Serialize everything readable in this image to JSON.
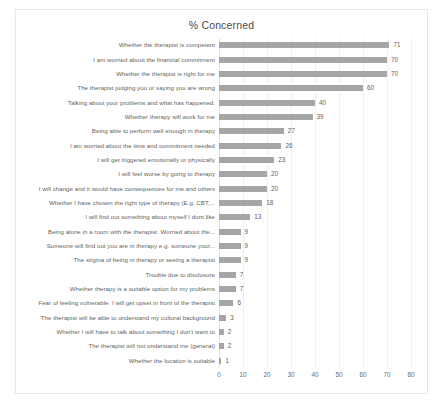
{
  "chart": {
    "title": "% Concerned"
  },
  "chart_data": {
    "type": "bar",
    "orientation": "horizontal",
    "title": "% Concerned",
    "xlabel": "",
    "ylabel": "",
    "xlim": [
      0,
      80
    ],
    "xticks": [
      0,
      10,
      20,
      30,
      40,
      50,
      60,
      70,
      80
    ],
    "grid": true,
    "legend": false,
    "bar_color": "#a6a6a6",
    "categories": [
      "Whether the therapist is competent",
      "I am worried about the financial commitment",
      "Whether the therapist is right for me",
      "The therapist judging you or saying you are wrong",
      "Talking about your problems and what has happened.",
      "Whether therapy will work for me",
      "Being able to perform well enough in therapy",
      "I am worried about the time and commitment needed",
      "I will get triggered emotionally or physically",
      "I will feel worse by going to therapy",
      "I will change and it would have consequences for me and others",
      "Whether I have chosen the right type of therapy (E.g. CBT,...",
      "I will find out something about myself I dont like",
      "Being alone in a room with the therapist. Worried about the...",
      "Someone will find out you are in therapy e.g. someone your...",
      "The stigma of being in therapy or seeing a therapist",
      "Trouble due to disclosure",
      "Whether therapy is a suitable option for my problems",
      "Fear of feeling vulnerable. I will get upset in front of the therapist",
      "The therapist will be able to understand my cultural background",
      "Whether I will have to talk about something I don't want to",
      "The therapist will not understand me (general)",
      "Whether the location is suitable"
    ],
    "values": [
      71,
      70,
      70,
      60,
      40,
      39,
      27,
      26,
      23,
      20,
      20,
      18,
      13,
      9,
      9,
      9,
      7,
      7,
      6,
      3,
      2,
      2,
      1
    ]
  }
}
